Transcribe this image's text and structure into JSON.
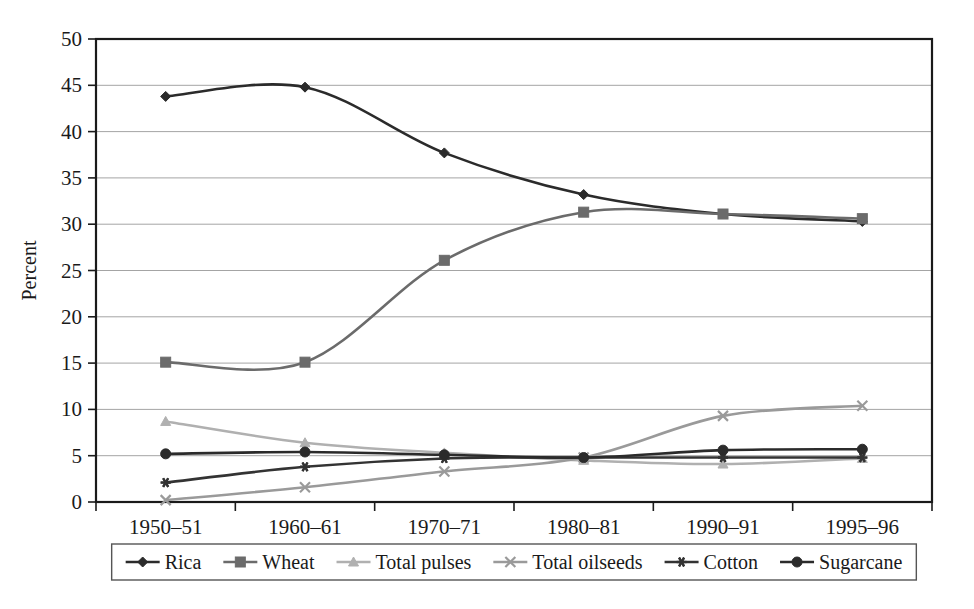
{
  "chart_data": {
    "type": "line",
    "title": "",
    "subtitle": "",
    "xlabel": "",
    "ylabel": "Percent",
    "categories": [
      "1950–51",
      "1960–61",
      "1970–71",
      "1980–81",
      "1990–91",
      "1995–96"
    ],
    "ylim": [
      0,
      50
    ],
    "ytick_step": 5,
    "yticks": [
      "0",
      "5",
      "10",
      "15",
      "20",
      "25",
      "30",
      "35",
      "40",
      "45",
      "50"
    ],
    "grid": "horizontal",
    "legend_position": "bottom",
    "smoothing": "spline",
    "series": [
      {
        "name": "Rica",
        "marker": "diamond",
        "color": "#2b2b2b",
        "values": [
          43.8,
          44.8,
          37.7,
          33.2,
          31.1,
          30.3
        ]
      },
      {
        "name": "Wheat",
        "marker": "square",
        "color": "#6b6b6b",
        "values": [
          15.1,
          15.1,
          26.1,
          31.3,
          31.1,
          30.6
        ]
      },
      {
        "name": "Total pulses",
        "marker": "triangle",
        "color": "#b0b0b0",
        "values": [
          8.7,
          6.4,
          5.3,
          4.5,
          4.1,
          4.7
        ]
      },
      {
        "name": "Total oilseeds",
        "marker": "cross",
        "color": "#9a9a9a",
        "values": [
          0.2,
          1.6,
          3.3,
          4.8,
          9.3,
          10.4
        ]
      },
      {
        "name": "Cotton",
        "marker": "asterisk",
        "color": "#333333",
        "values": [
          2.1,
          3.8,
          4.7,
          4.8,
          4.8,
          4.8
        ]
      },
      {
        "name": "Sugarcane",
        "marker": "circle",
        "color": "#2b2b2b",
        "values": [
          5.2,
          5.4,
          5.1,
          4.8,
          5.6,
          5.7
        ]
      }
    ]
  },
  "axes": {
    "y_title": "Percent",
    "y_ticks": [
      "50",
      "45",
      "40",
      "35",
      "30",
      "25",
      "20",
      "15",
      "10",
      "5",
      "0"
    ],
    "x_ticks": [
      "1950–51",
      "1960–61",
      "1970–71",
      "1980–81",
      "1990–91",
      "1995–96"
    ]
  },
  "legend": {
    "items": [
      {
        "label": "Rica",
        "marker": "diamond",
        "color": "#2b2b2b"
      },
      {
        "label": "Wheat",
        "marker": "square",
        "color": "#6b6b6b"
      },
      {
        "label": "Total pulses",
        "marker": "triangle",
        "color": "#b0b0b0"
      },
      {
        "label": "Total oilseeds",
        "marker": "cross",
        "color": "#9a9a9a"
      },
      {
        "label": "Cotton",
        "marker": "asterisk",
        "color": "#333333"
      },
      {
        "label": "Sugarcane",
        "marker": "circle",
        "color": "#2b2b2b"
      }
    ]
  },
  "colors": {
    "background": "#ffffff",
    "axis": "#1a1a1a",
    "grid": "#9a9a9a"
  }
}
